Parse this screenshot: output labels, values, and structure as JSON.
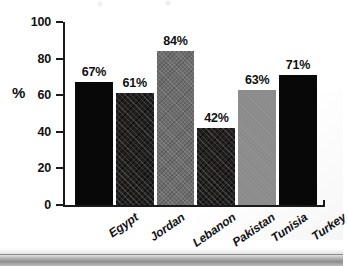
{
  "chart_data": {
    "type": "bar",
    "title": "",
    "subtitle": "",
    "xlabel": "",
    "ylabel": "%",
    "ylim": [
      0,
      100
    ],
    "grid": false,
    "legend": "none",
    "orientation": "vertical",
    "value_suffix": "%",
    "categories": [
      "Egypt",
      "Jordan",
      "Lebanon",
      "Pakistan",
      "Tunisia",
      "Turkey"
    ],
    "values": [
      67,
      61,
      84,
      42,
      63,
      71
    ],
    "value_labels": [
      "67%",
      "61%",
      "84%",
      "42%",
      "63%",
      "71%"
    ],
    "y_ticks": [
      0,
      20,
      40,
      60,
      80,
      100
    ],
    "y_tick_labels": [
      "0",
      "20",
      "40",
      "60",
      "80",
      "100"
    ],
    "bar_styles": [
      "solid-black",
      "hatch-dark",
      "texture-gray",
      "hatch-dark",
      "flat-gray",
      "solid-black"
    ],
    "colors": {
      "solid_black": "#080808",
      "hatch_dark": "#23211f",
      "texture_gray": "#6d6d6d",
      "flat_gray": "#8b8b8b",
      "axis": "#1a1a1a",
      "text": "#111111",
      "background": "#ffffff"
    },
    "bars": [
      {
        "category": "Egypt",
        "value": 67,
        "label": "67%",
        "style": "solid-black"
      },
      {
        "category": "Jordan",
        "value": 61,
        "label": "61%",
        "style": "hatch-dark"
      },
      {
        "category": "Lebanon",
        "value": 84,
        "label": "84%",
        "style": "texture-gray"
      },
      {
        "category": "Pakistan",
        "value": 42,
        "label": "42%",
        "style": "hatch-dark"
      },
      {
        "category": "Tunisia",
        "value": 63,
        "label": "63%",
        "style": "flat-gray"
      },
      {
        "category": "Turkey",
        "value": 71,
        "label": "71%",
        "style": "solid-black"
      }
    ]
  }
}
